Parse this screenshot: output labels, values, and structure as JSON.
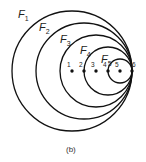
{
  "diagram": {
    "circles": [
      {
        "label": "F",
        "sub": "1"
      },
      {
        "label": "F",
        "sub": "2"
      },
      {
        "label": "F",
        "sub": "3"
      },
      {
        "label": "F",
        "sub": "4"
      },
      {
        "label": "F",
        "sub": "5"
      }
    ],
    "points": [
      "1",
      "2",
      "3",
      "4",
      "5",
      "6"
    ],
    "caption": "(b)"
  }
}
